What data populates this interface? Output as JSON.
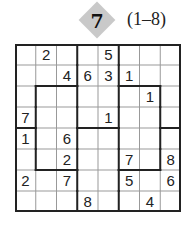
{
  "header": {
    "puzzle_number": "7",
    "range": "(1–8)",
    "badge_color": "#c9c9c9"
  },
  "puzzle": {
    "size": 8,
    "grid": [
      [
        "",
        "2",
        "",
        "",
        "5",
        "",
        "",
        ""
      ],
      [
        "",
        "",
        "4",
        "6",
        "3",
        "1",
        "",
        ""
      ],
      [
        "",
        "",
        "",
        "",
        "",
        "",
        "1",
        ""
      ],
      [
        "7",
        "",
        "",
        "",
        "1",
        "",
        "",
        ""
      ],
      [
        "1",
        "",
        "6",
        "",
        "",
        "",
        "",
        ""
      ],
      [
        "",
        "",
        "2",
        "",
        "",
        "7",
        "",
        "8"
      ],
      [
        "2",
        "",
        "7",
        "",
        "",
        "5",
        "",
        "6"
      ],
      [
        "",
        "",
        "",
        "8",
        "",
        "",
        "4",
        ""
      ]
    ],
    "regions": [
      [
        "A",
        "A",
        "A",
        "B",
        "B",
        "C",
        "C",
        "C"
      ],
      [
        "A",
        "A",
        "A",
        "B",
        "B",
        "C",
        "C",
        "C"
      ],
      [
        "A",
        "D",
        "D",
        "B",
        "B",
        "E",
        "E",
        "C"
      ],
      [
        "A",
        "D",
        "D",
        "B",
        "B",
        "E",
        "E",
        "C"
      ],
      [
        "F",
        "D",
        "D",
        "G",
        "G",
        "E",
        "E",
        "H"
      ],
      [
        "F",
        "D",
        "D",
        "G",
        "G",
        "E",
        "E",
        "H"
      ],
      [
        "F",
        "F",
        "F",
        "G",
        "G",
        "H",
        "H",
        "H"
      ],
      [
        "F",
        "F",
        "F",
        "G",
        "G",
        "H",
        "H",
        "H"
      ]
    ]
  }
}
